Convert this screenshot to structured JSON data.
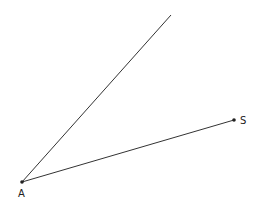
{
  "diagram": {
    "points": [
      {
        "id": "A",
        "label": "A",
        "x": 22,
        "y": 182
      },
      {
        "id": "S",
        "label": "S",
        "x": 234,
        "y": 120
      }
    ],
    "rays": [
      {
        "from": "A",
        "to_x": 171,
        "to_y": 15
      },
      {
        "from": "A",
        "through": "S"
      }
    ],
    "colors": {
      "line": "#333333",
      "point": "#222222"
    }
  }
}
